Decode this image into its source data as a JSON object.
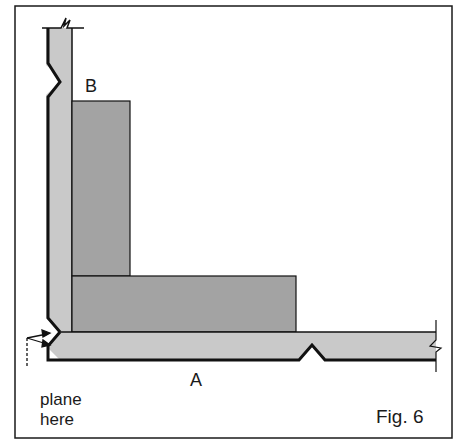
{
  "figure": {
    "caption": "Fig. 6",
    "labels": {
      "board_b": "B",
      "board_a": "A",
      "instruction_line1": "plane",
      "instruction_line2": "here"
    },
    "colors": {
      "frame": "#1a1a1a",
      "outline": "#111111",
      "board_light": "#c9c9c9",
      "board_dark": "#a3a3a3",
      "background": "#ffffff"
    },
    "parts": [
      {
        "id": "vertical-board",
        "description": "Upright board with break line at top and V-notch on outer edge"
      },
      {
        "id": "board-b",
        "description": "Vertical dark block labelled B"
      },
      {
        "id": "horizontal-block",
        "description": "Horizontal dark block resting on board A"
      },
      {
        "id": "board-a",
        "description": "Horizontal board labelled A with V-notch on lower edge and break line at right"
      },
      {
        "id": "mitre-corner",
        "description": "Chamfered corner joint with arrows indicating where to plane"
      }
    ]
  }
}
